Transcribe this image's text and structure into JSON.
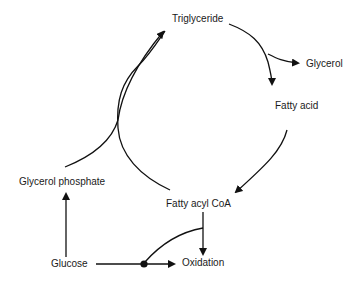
{
  "diagram": {
    "nodes": {
      "triglyceride": "Triglyceride",
      "glycerol": "Glycerol",
      "fatty_acid": "Fatty acid",
      "fatty_acyl_coa": "Fatty acyl CoA",
      "glycerol_phosphate": "Glycerol phosphate",
      "glucose": "Glucose",
      "oxidation": "Oxidation"
    },
    "edges": [
      {
        "from": "Triglyceride",
        "to": "Glycerol"
      },
      {
        "from": "Triglyceride",
        "to": "Fatty acid"
      },
      {
        "from": "Fatty acid",
        "to": "Fatty acyl CoA"
      },
      {
        "from": "Fatty acyl CoA",
        "to": "Triglyceride"
      },
      {
        "from": "Glycerol phosphate",
        "to": "Triglyceride"
      },
      {
        "from": "Fatty acyl CoA",
        "to": "Oxidation"
      },
      {
        "from": "Glucose",
        "to": "Glycerol phosphate"
      },
      {
        "from": "Glucose",
        "to": "Oxidation"
      },
      {
        "from": "Fatty acyl CoA",
        "to": "Glucose-Oxidation junction",
        "type": "inhibition/modulation"
      }
    ]
  }
}
